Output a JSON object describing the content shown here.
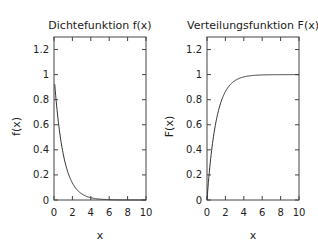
{
  "chart_data": [
    {
      "type": "line",
      "title": "Dichtefunktion f(x)",
      "xlabel": "x",
      "ylabel": "f(x)",
      "xlim": [
        0,
        10
      ],
      "ylim": [
        0,
        1.3
      ],
      "xticks": [
        "0",
        "2",
        "4",
        "6",
        "8",
        "10"
      ],
      "yticks": [
        "0",
        "0.2",
        "0.4",
        "0.6",
        "0.8",
        "1",
        "1.2"
      ],
      "series": [
        {
          "name": "f(x)",
          "x": [
            0.1,
            0.5,
            1,
            1.5,
            2,
            3,
            4,
            5,
            6,
            7,
            8,
            9,
            10
          ],
          "values": [
            0.9,
            0.61,
            0.37,
            0.22,
            0.14,
            0.05,
            0.02,
            0.007,
            0.002,
            0.001,
            0,
            0,
            0
          ]
        }
      ]
    },
    {
      "type": "line",
      "title": "Verteilungsfunktion F(x)",
      "xlabel": "x",
      "ylabel": "F(x)",
      "xlim": [
        0,
        10
      ],
      "ylim": [
        0,
        1.3
      ],
      "xticks": [
        "0",
        "2",
        "4",
        "6",
        "8",
        "10"
      ],
      "yticks": [
        "0",
        "0.2",
        "0.4",
        "0.6",
        "0.8",
        "1",
        "1.2"
      ],
      "series": [
        {
          "name": "F(x)",
          "x": [
            0,
            0.25,
            0.5,
            1,
            1.5,
            2,
            3,
            4,
            5,
            6,
            8,
            10
          ],
          "values": [
            0,
            0.22,
            0.39,
            0.63,
            0.78,
            0.86,
            0.95,
            0.98,
            0.99,
            1.0,
            1.0,
            1.0
          ]
        }
      ]
    }
  ]
}
